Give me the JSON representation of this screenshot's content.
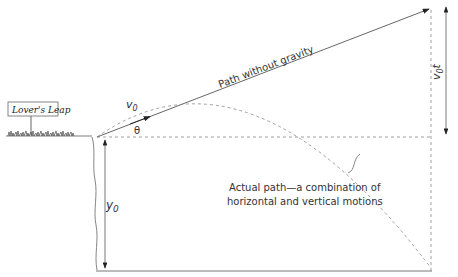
{
  "diagram": {
    "sign_text": "Lover's Leap",
    "v0_label": "v",
    "v0_sub": "0",
    "theta_label": "θ",
    "path_without_gravity": "Path without gravity",
    "v0t_label_v": "v",
    "v0t_label_sub": "0",
    "v0t_label_t": "t",
    "y0_label_y": "y",
    "y0_label_sub": "0",
    "actual_path_line1": "Actual path—a combination of",
    "actual_path_line2": "horizontal and vertical motions"
  },
  "colors": {
    "line": "#555555",
    "dashed": "#888888",
    "text": "#333333"
  }
}
